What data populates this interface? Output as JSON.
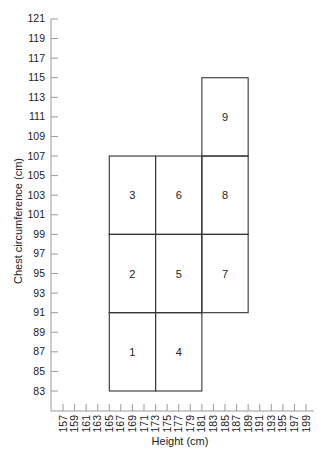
{
  "chart_data": {
    "type": "heatmap",
    "title": "",
    "xlabel": "Height (cm)",
    "ylabel": "Chest circumference (cm)",
    "xlim": [
      155,
      200
    ],
    "ylim": [
      81,
      121
    ],
    "x_ticks": [
      157,
      159,
      161,
      163,
      165,
      167,
      169,
      171,
      173,
      175,
      177,
      179,
      181,
      183,
      185,
      187,
      189,
      191,
      193,
      195,
      197,
      199
    ],
    "y_ticks": [
      83,
      85,
      87,
      89,
      91,
      93,
      95,
      97,
      99,
      101,
      103,
      105,
      107,
      109,
      111,
      113,
      115,
      117,
      119,
      121
    ],
    "grid": false,
    "legend": null,
    "cells": [
      {
        "label": "1",
        "x0": 165,
        "x1": 173,
        "y0": 83,
        "y1": 91
      },
      {
        "label": "2",
        "x0": 165,
        "x1": 173,
        "y0": 91,
        "y1": 99
      },
      {
        "label": "3",
        "x0": 165,
        "x1": 173,
        "y0": 99,
        "y1": 107
      },
      {
        "label": "4",
        "x0": 173,
        "x1": 181,
        "y0": 83,
        "y1": 91
      },
      {
        "label": "5",
        "x0": 173,
        "x1": 181,
        "y0": 91,
        "y1": 99
      },
      {
        "label": "6",
        "x0": 173,
        "x1": 181,
        "y0": 99,
        "y1": 107
      },
      {
        "label": "7",
        "x0": 181,
        "x1": 189,
        "y0": 91,
        "y1": 99
      },
      {
        "label": "8",
        "x0": 181,
        "x1": 189,
        "y0": 99,
        "y1": 107
      },
      {
        "label": "9",
        "x0": 181,
        "x1": 189,
        "y0": 107,
        "y1": 115
      }
    ]
  },
  "colors": {
    "axis": "#9a9a9a",
    "box_stroke": "#333333",
    "text": "#222222",
    "background": "#ffffff"
  }
}
